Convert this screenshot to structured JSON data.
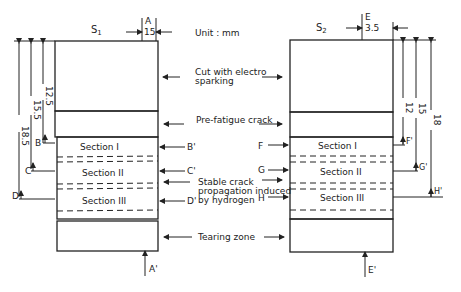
{
  "unit": "Unit : mm",
  "annotations": {
    "cut": [
      "Cut with electro",
      "sparking"
    ],
    "prefatigue": "Pre-fatigue crack",
    "stable": [
      "Stable crack",
      "propagation induced",
      "by hydrogen"
    ],
    "tearing": "Tearing zone"
  },
  "specimen_left": {
    "name": "S",
    "sub": "1",
    "cut_label": "A",
    "cut_label_end": "A'",
    "cut_dim": "15",
    "sections": [
      "Section I",
      "Section II",
      "Section III"
    ],
    "dims": [
      "12.5",
      "15.5",
      "18.5"
    ],
    "markers_left": [
      "B",
      "C",
      "D"
    ],
    "markers_right": [
      "B'",
      "C'",
      "D'"
    ]
  },
  "specimen_right": {
    "name": "S",
    "sub": "2",
    "cut_label": "E",
    "cut_label_end": "E'",
    "cut_dim": "3.5",
    "sections": [
      "Section I",
      "Section II",
      "Section III"
    ],
    "dims": [
      "12",
      "15",
      "18"
    ],
    "markers_left": [
      "F",
      "G",
      "H"
    ],
    "markers_right": [
      "F'",
      "G'",
      "H'"
    ]
  }
}
